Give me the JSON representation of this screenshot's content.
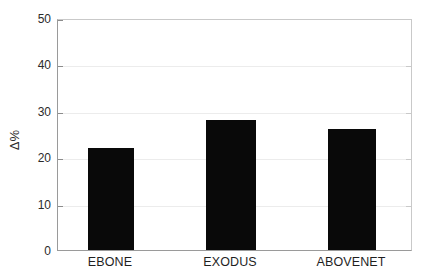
{
  "chart_data": {
    "type": "bar",
    "title": "",
    "subtitle": "",
    "xlabel": "",
    "ylabel": "Δ%",
    "categories": [
      "EBONE",
      "EXODUS",
      "ABOVENET"
    ],
    "values": [
      22,
      28,
      26
    ],
    "series": [
      {
        "name": "Δ%",
        "values": [
          22,
          28,
          26
        ]
      }
    ],
    "ylim": [
      0,
      50
    ],
    "yticks": [
      0,
      10,
      20,
      30,
      40,
      50
    ],
    "ytick_labels": [
      "0",
      "10",
      "20",
      "30",
      "40",
      "50"
    ],
    "xtick_labels": [
      "EBONE",
      "EXODUS",
      "ABOVENET"
    ],
    "grid": true,
    "grid_axis": "y",
    "legend": false,
    "legend_position": "none",
    "annotations": [],
    "colors": {
      "bar_fill": "#090909",
      "axis_line": "#9a9a9a",
      "grid_line": "#ececec",
      "background": "#ffffff",
      "text": "#2b2b2b"
    }
  }
}
